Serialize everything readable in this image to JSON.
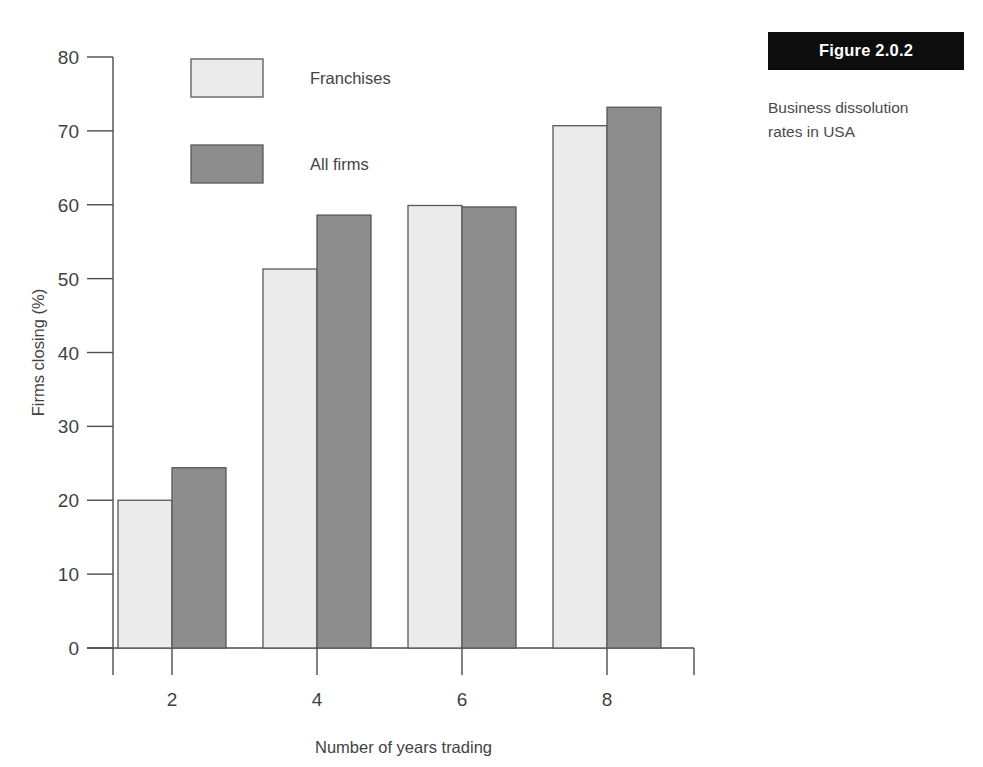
{
  "figure": {
    "badge_label": "Figure 2.0.2",
    "caption_line1": "Business dissolution",
    "caption_line2": "rates in USA",
    "caption_full": "Business dissolution rates in USA"
  },
  "colors": {
    "series_franchises": "#ebebeb",
    "series_all_firms": "#8d8d8d",
    "bar_outline": "#585858",
    "axis": "#4d4d4d",
    "text": "#3f3f3f",
    "badge_background": "#0d0d0d",
    "badge_text": "#ffffff"
  },
  "chart_data": {
    "type": "bar",
    "title": "",
    "categories": [
      "2",
      "4",
      "6",
      "8"
    ],
    "series": [
      {
        "name": "Franchises",
        "values": [
          20.0,
          51.3,
          59.9,
          70.7
        ]
      },
      {
        "name": "All firms",
        "values": [
          24.4,
          58.6,
          59.7,
          73.2
        ]
      }
    ],
    "xlabel": "Number of years trading",
    "ylabel": "Firms closing (%)",
    "ylim": [
      0,
      80
    ],
    "yticks": [
      0,
      10,
      20,
      30,
      40,
      50,
      60,
      70,
      80
    ],
    "ytick_labels": [
      "0",
      "10",
      "20",
      "30",
      "40",
      "50",
      "60",
      "70",
      "80"
    ],
    "xtick_labels": [
      "2",
      "4",
      "6",
      "8"
    ],
    "grid": false,
    "legend_position": "upper-left-inside",
    "legend_entries": [
      "Franchises",
      "All firms"
    ]
  }
}
